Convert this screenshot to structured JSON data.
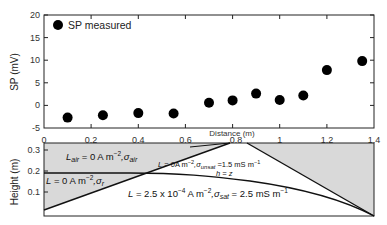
{
  "chart_data": [
    {
      "type": "scatter",
      "title": "",
      "xlabel": "Distance (m)",
      "ylabel": "SP (mV)",
      "xlim": [
        0,
        1.4
      ],
      "ylim": [
        -5,
        20
      ],
      "xticks": [
        "0",
        "0.2",
        "0.4",
        "0.6",
        "0.8",
        "1",
        "1.2",
        "1.4"
      ],
      "yticks": [
        "-5",
        "0",
        "5",
        "10",
        "15",
        "20"
      ],
      "legend": {
        "position": "upper-left",
        "entries": [
          "SP measured"
        ]
      },
      "grid": false,
      "series": [
        {
          "name": "SP measured",
          "x": [
            0.1,
            0.25,
            0.4,
            0.55,
            0.7,
            0.8,
            0.9,
            1.0,
            1.1,
            1.2,
            1.35
          ],
          "y": [
            -2.7,
            -2.2,
            -1.7,
            -1.8,
            0.6,
            1.1,
            2.6,
            1.2,
            2.2,
            7.8,
            9.8
          ]
        }
      ]
    },
    {
      "type": "diagram",
      "ylabel": "Height (m)",
      "xlim": [
        0,
        1.4
      ],
      "ylim": [
        0,
        0.35
      ],
      "yticks": [
        "0.1",
        "0.2",
        "0.3"
      ],
      "annotations": {
        "air": "L_air = 0 A m^-2, σ_air",
        "left": "L = 0 A m^-2, σ_r",
        "unsat": "L = 0 A m^-2, σ_unsat = 1.5 mS m^-1",
        "water_table": "h = z",
        "sat": "L = 2.5 x 10^-4 A m^-2, σ_sat = 2.5 mS m^-1"
      }
    }
  ],
  "top": {
    "ylabel": "SP (mV)",
    "xlabel": "Distance (m)",
    "legend_label": "SP measured",
    "yticks": [
      "20",
      "15",
      "10",
      "5",
      "0",
      "-5"
    ],
    "xticks": [
      "0",
      "0.2",
      "0.4",
      "0.6",
      "0.8",
      "1",
      "1.2",
      "1.4"
    ]
  },
  "bottom": {
    "ylabel": "Height (m)",
    "yticks": [
      "0.3",
      "0.2",
      "0.1"
    ],
    "air_L": "L",
    "air_sub": "air",
    "air_rest": " = 0 A m",
    "air_exp": "−2",
    "air_sigma": ",σ",
    "air_sigma_sub": "air",
    "left_L": "L",
    "left_rest": " = 0 A m",
    "left_exp": "−2",
    "left_sigma": ",σ",
    "left_sigma_sub": "r",
    "unsat_L": "L",
    "unsat_rest": " = 0A m",
    "unsat_exp": "−2",
    "unsat_sigma": ",σ",
    "unsat_sigma_sub": "unsat",
    "unsat_val": " =1.5 mS m",
    "unsat_val_exp": "−1",
    "wt": "h = z",
    "sat_L": "L",
    "sat_rest": " = 2.5 x 10",
    "sat_exp1": "−4",
    "sat_rest2": " A m",
    "sat_exp2": "−2",
    "sat_sigma": ",σ",
    "sat_sigma_sub": "sat",
    "sat_val": " = 2.5 mS m",
    "sat_val_exp": "−1"
  },
  "colors": {
    "marker": "#000000",
    "shade": "#d9d9d9",
    "axis": "#222222"
  }
}
